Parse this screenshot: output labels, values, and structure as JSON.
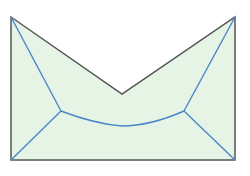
{
  "diagram": {
    "title": "",
    "colors": {
      "fill": "#e6f4e6",
      "outline": "#555555",
      "skeleton": "#4a86c8",
      "background": "#ffffff"
    }
  }
}
